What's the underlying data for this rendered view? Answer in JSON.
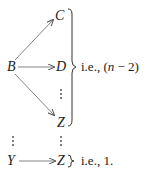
{
  "diagram": {
    "nodes": {
      "B": "B",
      "C": "C",
      "D": "D",
      "Z_top": "Z",
      "Y": "Y",
      "Z_bottom": "Z"
    },
    "edges": [
      {
        "from": "B",
        "to": "C"
      },
      {
        "from": "B",
        "to": "D"
      },
      {
        "from": "B",
        "to": "Z"
      },
      {
        "from": "Y",
        "to": "Z"
      }
    ],
    "annotations": {
      "group_label_prefix": "i.e., (",
      "group_label_var": "n",
      "group_label_suffix": " − 2)",
      "single_label": "i.e., 1."
    },
    "ellipsis": "⋮",
    "colors": {
      "text": "#222222",
      "arrow": "#555555"
    }
  }
}
